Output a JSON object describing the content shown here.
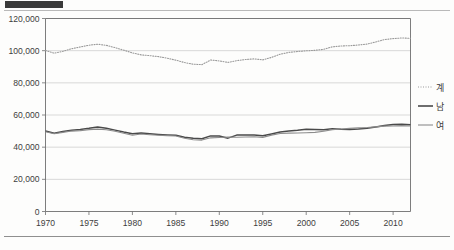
{
  "header": {
    "tag_block_color": "#3a3a3a"
  },
  "chart_data": {
    "type": "line",
    "title": "",
    "subtitle": "",
    "xlabel": "",
    "ylabel": "",
    "xlim": [
      1970,
      2012
    ],
    "ylim": [
      0,
      120000
    ],
    "grid": true,
    "legend_position": "right",
    "y_ticks": [
      0,
      20000,
      40000,
      60000,
      80000,
      100000,
      120000
    ],
    "y_tick_labels": [
      "0",
      "20,000",
      "40,000",
      "60,000",
      "80,000",
      "100,000",
      "120,000"
    ],
    "x_ticks": [
      1970,
      1975,
      1980,
      1985,
      1990,
      1995,
      2000,
      2005,
      2010
    ],
    "x_tick_labels": [
      "1970",
      "1975",
      "1980",
      "1985",
      "1990",
      "1995",
      "2000",
      "2005",
      "2010"
    ],
    "x": [
      1970,
      1971,
      1972,
      1973,
      1974,
      1975,
      1976,
      1977,
      1978,
      1979,
      1980,
      1981,
      1982,
      1983,
      1984,
      1985,
      1986,
      1987,
      1988,
      1989,
      1990,
      1991,
      1992,
      1993,
      1994,
      1995,
      1996,
      1997,
      1998,
      1999,
      2000,
      2001,
      2002,
      2003,
      2004,
      2005,
      2006,
      2007,
      2008,
      2009,
      2010,
      2011,
      2012
    ],
    "series": [
      {
        "name": "계",
        "style": "dotted",
        "color": "#9a9a9a",
        "values": [
          100100,
          98400,
          99600,
          101200,
          102300,
          103400,
          104000,
          103300,
          101900,
          100300,
          98600,
          97400,
          96900,
          96300,
          95300,
          94100,
          92600,
          91600,
          91300,
          94200,
          93600,
          92700,
          93800,
          94500,
          94900,
          94300,
          95800,
          97800,
          98900,
          99500,
          99900,
          100200,
          100800,
          102400,
          102900,
          103100,
          103500,
          104100,
          105400,
          106900,
          107500,
          107900,
          107700
        ]
      },
      {
        "name": "남",
        "style": "solid-thick",
        "color": "#4a4a4a",
        "values": [
          50000,
          48600,
          49700,
          50500,
          51000,
          51700,
          52600,
          51800,
          50600,
          49400,
          48400,
          48800,
          48300,
          47900,
          47600,
          47400,
          46200,
          45500,
          45200,
          47000,
          46900,
          45600,
          47500,
          47500,
          47600,
          47100,
          48200,
          49400,
          50000,
          50500,
          51200,
          51000,
          50900,
          51400,
          51100,
          51000,
          51300,
          51800,
          52600,
          53500,
          54100,
          54200,
          54000
        ]
      },
      {
        "name": "여",
        "style": "solid-thin",
        "color": "#8c8c8c",
        "values": [
          49600,
          48300,
          49200,
          50000,
          50300,
          50900,
          51200,
          50800,
          49900,
          48700,
          47400,
          48200,
          47700,
          47400,
          47200,
          46900,
          45500,
          44600,
          44400,
          45800,
          46000,
          46300,
          46200,
          46300,
          46500,
          46100,
          47500,
          48500,
          48700,
          48800,
          49000,
          49200,
          49900,
          50900,
          51300,
          51700,
          52000,
          52200,
          52600,
          53100,
          53200,
          53400,
          53200
        ]
      }
    ],
    "legend": [
      {
        "label": "계",
        "marker": "dotted-line"
      },
      {
        "label": "남",
        "marker": "thick-solid-line"
      },
      {
        "label": "여",
        "marker": "thin-solid-line"
      }
    ]
  }
}
